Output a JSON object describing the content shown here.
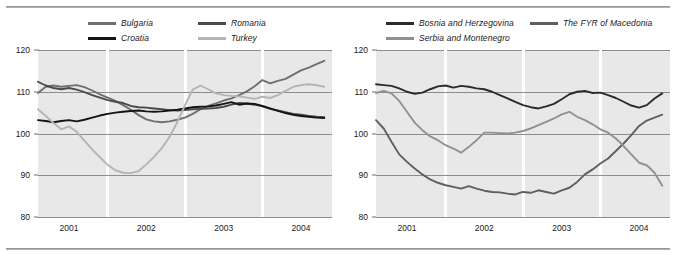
{
  "figure": {
    "separator_top": "horizontal-rule",
    "separator_bottom": "horizontal-rule"
  },
  "panels": [
    {
      "id": "left",
      "legend": [
        {
          "label": "Bulgaria",
          "color": "#6f6f6f"
        },
        {
          "label": "Romania",
          "color": "#4a4a4a"
        },
        {
          "label": "Croatia",
          "color": "#141414"
        },
        {
          "label": "Turkey",
          "color": "#b4b4b4"
        }
      ],
      "yticks": [
        "80",
        "90",
        "100",
        "110",
        "120"
      ],
      "xticks": [
        "2001",
        "2002",
        "2003",
        "2004"
      ]
    },
    {
      "id": "right",
      "legend": [
        {
          "label": "Bosnia and Herzegovina",
          "color": "#2b2b2b"
        },
        {
          "label": "The FYR of Macedonia",
          "color": "#5f5f5f"
        },
        {
          "label": "Serbia and Montenegro",
          "color": "#919191"
        }
      ],
      "yticks": [
        "80",
        "90",
        "100",
        "110",
        "120"
      ],
      "xticks": [
        "2001",
        "2002",
        "2003",
        "2004"
      ]
    }
  ],
  "chart_data": [
    {
      "type": "line",
      "title": "",
      "xlabel": "",
      "ylabel": "",
      "ylim": [
        80,
        120
      ],
      "yticks": [
        80,
        90,
        100,
        110,
        120
      ],
      "grid": true,
      "legend_position": "top",
      "xlim": [
        2000.6,
        2004.4
      ],
      "xticks": [
        2001,
        2002,
        2003,
        2004
      ],
      "x": [
        2000.6,
        2000.7,
        2000.8,
        2000.9,
        2001.0,
        2001.1,
        2001.2,
        2001.3,
        2001.4,
        2001.5,
        2001.6,
        2001.7,
        2001.8,
        2001.9,
        2002.0,
        2002.1,
        2002.2,
        2002.3,
        2002.4,
        2002.5,
        2002.6,
        2002.7,
        2002.8,
        2002.9,
        2003.0,
        2003.1,
        2003.2,
        2003.3,
        2003.4,
        2003.5,
        2003.6,
        2003.7,
        2003.8,
        2003.9,
        2004.0,
        2004.1,
        2004.2,
        2004.3
      ],
      "series": [
        {
          "name": "Bulgaria",
          "color": "#6f6f6f",
          "values": [
            109.7,
            111.2,
            111.5,
            111.2,
            111.4,
            111.6,
            111.1,
            110.3,
            109.4,
            108.6,
            107.8,
            106.8,
            105.7,
            104.4,
            103.4,
            102.9,
            102.7,
            102.9,
            103.3,
            103.8,
            104.7,
            105.8,
            106.6,
            107.2,
            107.9,
            108.4,
            109.2,
            110.1,
            111.3,
            112.8,
            112.0,
            112.6,
            113.1,
            114.1,
            115.1,
            115.8,
            116.6,
            117.4
          ]
        },
        {
          "name": "Romania",
          "color": "#4a4a4a",
          "values": [
            112.4,
            111.5,
            110.9,
            110.6,
            110.9,
            110.5,
            109.9,
            109.2,
            108.6,
            108.0,
            107.6,
            107.3,
            106.6,
            106.3,
            106.2,
            106.0,
            105.8,
            105.6,
            105.5,
            105.6,
            105.8,
            105.9,
            106.0,
            106.1,
            106.4,
            106.9,
            107.3,
            107.2,
            106.9,
            106.5,
            105.9,
            105.5,
            105.1,
            104.7,
            104.5,
            104.2,
            104.0,
            103.9
          ]
        },
        {
          "name": "Croatia",
          "color": "#141414",
          "values": [
            103.2,
            103.0,
            102.7,
            103.0,
            103.2,
            102.9,
            103.3,
            103.8,
            104.3,
            104.7,
            105.0,
            105.2,
            105.4,
            105.5,
            105.3,
            105.2,
            105.3,
            105.5,
            105.7,
            106.0,
            106.3,
            106.4,
            106.5,
            106.7,
            107.1,
            107.5,
            106.9,
            107.2,
            107.1,
            106.6,
            106.0,
            105.4,
            104.9,
            104.5,
            104.2,
            104.0,
            103.8,
            103.7
          ]
        },
        {
          "name": "Turkey",
          "color": "#b4b4b4",
          "values": [
            105.8,
            104.2,
            102.5,
            101.0,
            101.7,
            100.4,
            98.3,
            96.2,
            94.3,
            92.5,
            91.2,
            90.6,
            90.5,
            91.0,
            92.6,
            94.4,
            96.5,
            99.2,
            102.7,
            106.8,
            110.5,
            111.5,
            110.6,
            109.6,
            109.2,
            109.0,
            108.9,
            108.6,
            108.3,
            108.8,
            108.5,
            109.2,
            110.2,
            111.2,
            111.6,
            111.8,
            111.6,
            111.2
          ]
        }
      ]
    },
    {
      "type": "line",
      "title": "",
      "xlabel": "",
      "ylabel": "",
      "ylim": [
        80,
        120
      ],
      "yticks": [
        80,
        90,
        100,
        110,
        120
      ],
      "grid": true,
      "legend_position": "top",
      "xlim": [
        2000.6,
        2004.4
      ],
      "xticks": [
        2001,
        2002,
        2003,
        2004
      ],
      "x": [
        2000.6,
        2000.7,
        2000.8,
        2000.9,
        2001.0,
        2001.1,
        2001.2,
        2001.3,
        2001.4,
        2001.5,
        2001.6,
        2001.7,
        2001.8,
        2001.9,
        2002.0,
        2002.1,
        2002.2,
        2002.3,
        2002.4,
        2002.5,
        2002.6,
        2002.7,
        2002.8,
        2002.9,
        2003.0,
        2003.1,
        2003.2,
        2003.3,
        2003.4,
        2003.5,
        2003.6,
        2003.7,
        2003.8,
        2003.9,
        2004.0,
        2004.1,
        2004.2,
        2004.3
      ],
      "series": [
        {
          "name": "Bosnia and Herzegovina",
          "color": "#2b2b2b",
          "values": [
            111.8,
            111.6,
            111.4,
            110.8,
            110.0,
            109.5,
            109.8,
            110.6,
            111.3,
            111.5,
            111.0,
            111.4,
            111.2,
            110.8,
            110.6,
            110.0,
            109.2,
            108.4,
            107.6,
            106.8,
            106.3,
            106.0,
            106.5,
            107.1,
            108.2,
            109.4,
            110.0,
            110.2,
            109.7,
            109.8,
            109.2,
            108.5,
            107.6,
            106.7,
            106.2,
            106.8,
            108.4,
            109.6
          ]
        },
        {
          "name": "The FYR of Macedonia",
          "color": "#5f5f5f",
          "values": [
            103.2,
            101.2,
            98.0,
            95.0,
            93.2,
            91.6,
            90.2,
            89.0,
            88.2,
            87.6,
            87.2,
            86.8,
            87.4,
            86.8,
            86.3,
            86.0,
            85.9,
            85.6,
            85.4,
            86.0,
            85.8,
            86.4,
            86.0,
            85.6,
            86.4,
            87.0,
            88.4,
            90.2,
            91.4,
            92.8,
            94.0,
            95.8,
            97.6,
            99.6,
            101.8,
            103.1,
            103.8,
            104.5
          ]
        },
        {
          "name": "Serbia and Montenegro",
          "color": "#919191",
          "values": [
            109.7,
            110.2,
            109.6,
            107.8,
            105.2,
            102.6,
            100.8,
            99.3,
            98.4,
            97.2,
            96.4,
            95.4,
            96.8,
            98.4,
            100.2,
            100.2,
            100.1,
            100.0,
            100.2,
            100.6,
            101.2,
            102.0,
            102.8,
            103.6,
            104.6,
            105.2,
            104.0,
            103.2,
            102.2,
            101.0,
            100.2,
            98.8,
            97.0,
            95.0,
            93.0,
            92.4,
            90.6,
            87.5
          ]
        }
      ]
    }
  ]
}
